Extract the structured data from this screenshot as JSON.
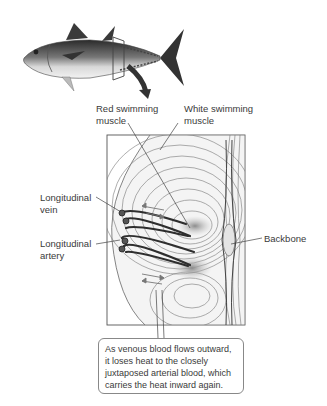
{
  "diagram": {
    "labels": {
      "red_muscle": [
        "Red swimming",
        "muscle"
      ],
      "white_muscle": [
        "White swimming",
        "muscle"
      ],
      "vein": [
        "Longitudinal",
        "vein"
      ],
      "artery": [
        "Longitudinal",
        "artery"
      ],
      "backbone": "Backbone"
    },
    "callout": [
      "As venous blood flows outward,",
      "it loses heat to the closely",
      "juxtaposed arterial blood, which",
      "carries the heat inward again."
    ],
    "colors": {
      "line": "#555555",
      "vessel": "#333333",
      "red_muscle_shade": "#9a9a9a",
      "panel_bg": "#f4f4f4"
    }
  }
}
